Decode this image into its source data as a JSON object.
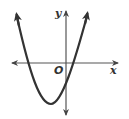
{
  "figure": {
    "type": "parabola-graph",
    "axes": {
      "x_label": "x",
      "y_label": "y",
      "origin_label": "O"
    },
    "curve": {
      "shape": "upward-opening parabola",
      "vertex_quadrant": "III",
      "x_intercepts": [
        "negative",
        "positive"
      ],
      "y_intercept": "negative",
      "color": "#333333"
    },
    "axis_color": "#555555"
  }
}
